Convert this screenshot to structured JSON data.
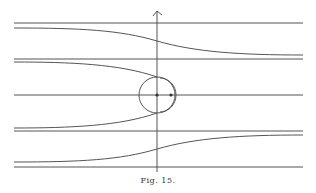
{
  "figure": {
    "caption": "Fig. 15.",
    "stroke_color": "#555555",
    "background": "#ffffff",
    "axis": {
      "x": 157,
      "y_top": 10,
      "y_bottom": 172,
      "arrow": "up"
    },
    "circle": {
      "cx": 157,
      "cy": 95,
      "r": 18
    },
    "offset_arc": {
      "cx": 161,
      "cy": 95,
      "r": 16
    },
    "center_dot": {
      "cx": 157,
      "cy": 95
    },
    "right_dot": {
      "cx": 171,
      "cy": 95
    },
    "straight_lines_y": [
      23,
      59,
      95,
      131,
      167
    ],
    "x_left": 14,
    "x_right": 303
  }
}
